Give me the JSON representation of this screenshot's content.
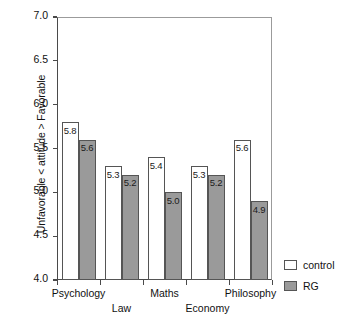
{
  "chart_data": {
    "type": "bar",
    "title": "",
    "xlabel": "",
    "ylabel": "Unfavorable < attitude > Favorable",
    "ylim": [
      4.0,
      7.0
    ],
    "y_ticks": [
      "7.0",
      "6.5",
      "6.0",
      "5.5",
      "5.0",
      "4.5",
      "4.0"
    ],
    "y_tick_values": [
      7.0,
      6.5,
      6.0,
      5.5,
      5.0,
      4.5,
      4.0
    ],
    "grid": false,
    "legend_position": "right-bottom-outside",
    "categories": [
      "Psychology",
      "Law",
      "Maths",
      "Economy",
      "Philosophy"
    ],
    "series": [
      {
        "name": "control",
        "color": "#ffffff",
        "values": [
          5.8,
          5.3,
          5.4,
          5.3,
          5.6
        ],
        "labels": [
          "5.8",
          "5.3",
          "5.4",
          "5.3",
          "5.6"
        ]
      },
      {
        "name": "RG",
        "color": "#9a9a9a",
        "values": [
          5.6,
          5.2,
          5.0,
          5.2,
          4.9
        ],
        "labels": [
          "5.6",
          "5.2",
          "5.0",
          "5.2",
          "4.9"
        ]
      }
    ]
  },
  "legend": {
    "items": [
      {
        "label": "control",
        "swatch": "control"
      },
      {
        "label": "RG",
        "swatch": "rg"
      }
    ]
  },
  "x_axis": {
    "stagger_rows": [
      {
        "row": 1,
        "label": "Psychology"
      },
      {
        "row": 2,
        "label": "Law"
      },
      {
        "row": 1,
        "label": "Maths"
      },
      {
        "row": 2,
        "label": "Economy"
      },
      {
        "row": 1,
        "label": "Philosophy"
      }
    ]
  },
  "colors": {
    "control_fill": "#ffffff",
    "rg_fill": "#9a9a9a",
    "bar_stroke": "#555555",
    "axis": "#4a4a4a",
    "background": "#ffffff"
  }
}
